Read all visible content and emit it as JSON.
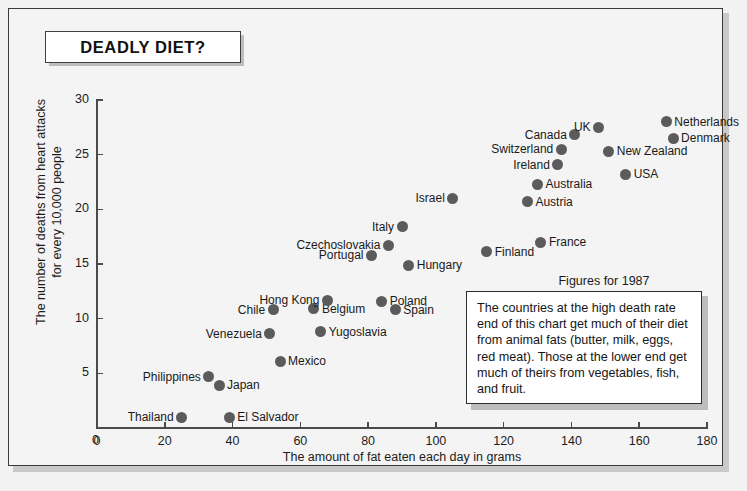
{
  "title": "DEADLY DIET?",
  "annotation": {
    "figures_note": "Figures for 1987",
    "box_text": "The countries at the high death rate end of this chart get much of their diet from animal fats (butter, milk, eggs, red meat). Those at the lower end get much of theirs from vegetables, fish, and fruit."
  },
  "chart_data": {
    "type": "scatter",
    "title": "DEADLY DIET?",
    "xlabel": "The amount of fat eaten each day in grams",
    "ylabel": "The number of deaths from heart attacks for every 10,000 people",
    "xlim": [
      0,
      180
    ],
    "ylim": [
      0,
      30
    ],
    "xticks": [
      0,
      20,
      40,
      60,
      80,
      100,
      120,
      140,
      160,
      180
    ],
    "yticks": [
      0,
      5,
      10,
      15,
      20,
      25,
      30
    ],
    "grid": false,
    "legend": "none",
    "marker_color": "#5b5b5b",
    "points": [
      {
        "label": "Thailand",
        "x": 25,
        "y": 1.0,
        "side": "left"
      },
      {
        "label": "El Salvador",
        "x": 39,
        "y": 1.0,
        "side": "right"
      },
      {
        "label": "Philippines",
        "x": 33,
        "y": 4.7,
        "side": "left"
      },
      {
        "label": "Japan",
        "x": 36,
        "y": 3.9,
        "side": "right"
      },
      {
        "label": "Mexico",
        "x": 54,
        "y": 6.1,
        "side": "right"
      },
      {
        "label": "Venezuela",
        "x": 51,
        "y": 8.6,
        "side": "left"
      },
      {
        "label": "Chile",
        "x": 52,
        "y": 10.8,
        "side": "left"
      },
      {
        "label": "Yugoslavia",
        "x": 66,
        "y": 8.8,
        "side": "right"
      },
      {
        "label": "Belgium",
        "x": 64,
        "y": 10.9,
        "side": "right"
      },
      {
        "label": "Hong Kong",
        "x": 68,
        "y": 11.7,
        "side": "left"
      },
      {
        "label": "Poland",
        "x": 84,
        "y": 11.6,
        "side": "right"
      },
      {
        "label": "Spain",
        "x": 88,
        "y": 10.8,
        "side": "right"
      },
      {
        "label": "Portugal",
        "x": 81,
        "y": 15.8,
        "side": "left"
      },
      {
        "label": "Czechoslovakia",
        "x": 86,
        "y": 16.7,
        "side": "left"
      },
      {
        "label": "Italy",
        "x": 90,
        "y": 18.4,
        "side": "left"
      },
      {
        "label": "Hungary",
        "x": 92,
        "y": 14.9,
        "side": "right"
      },
      {
        "label": "Israel",
        "x": 105,
        "y": 21.0,
        "side": "left"
      },
      {
        "label": "Finland",
        "x": 115,
        "y": 16.1,
        "side": "right"
      },
      {
        "label": "Austria",
        "x": 127,
        "y": 20.7,
        "side": "right"
      },
      {
        "label": "Australia",
        "x": 130,
        "y": 22.3,
        "side": "right"
      },
      {
        "label": "France",
        "x": 131,
        "y": 17.0,
        "side": "right"
      },
      {
        "label": "Ireland",
        "x": 136,
        "y": 24.1,
        "side": "left"
      },
      {
        "label": "Switzerland",
        "x": 137,
        "y": 25.5,
        "side": "left"
      },
      {
        "label": "Canada",
        "x": 141,
        "y": 26.8,
        "side": "left"
      },
      {
        "label": "UK",
        "x": 148,
        "y": 27.5,
        "side": "left"
      },
      {
        "label": "New Zealand",
        "x": 151,
        "y": 25.3,
        "side": "right"
      },
      {
        "label": "USA",
        "x": 156,
        "y": 23.2,
        "side": "right"
      },
      {
        "label": "Netherlands",
        "x": 168,
        "y": 28.0,
        "side": "right"
      },
      {
        "label": "Denmark",
        "x": 170,
        "y": 26.5,
        "side": "right"
      }
    ]
  }
}
